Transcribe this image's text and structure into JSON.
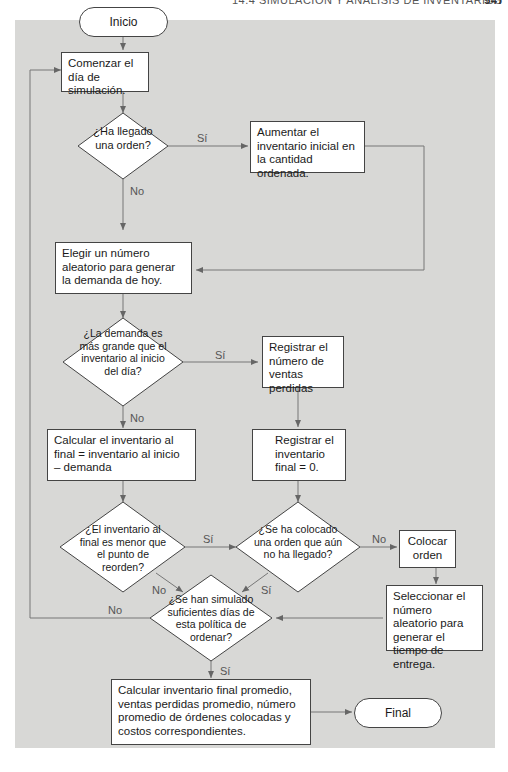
{
  "header": {
    "running_title": "14.4   SIMULACIÓN Y ANÁLISIS DE INVENTARIOS",
    "page_number": "547"
  },
  "flowchart": {
    "start": "Inicio",
    "end": "Final",
    "steps": {
      "begin_day": "Comenzar el día de simulación.",
      "increase_inventory": "Aumentar el inventario inicial en la cantidad ordenada.",
      "random_demand": "Elegir un número aleatorio para generar la demanda de hoy.",
      "record_lost_sales": "Registrar el número de ventas perdidas",
      "calc_ending_inventory": "Calcular el inventario al final = inventario al inicio – demanda",
      "record_zero_inventory": "Registrar el inventario final = 0.",
      "place_order": "Colocar orden",
      "random_lead_time": "Seleccionar el número aleatorio para generar el tiempo de entrega.",
      "compute_results": "Calcular inventario final promedio, ventas perdidas promedio, número promedio de órdenes colocadas y costos correspondientes."
    },
    "decisions": {
      "order_arrived": "¿Ha llegado una orden?",
      "demand_gt_inventory": "¿La demanda es más grande que el inventario al inicio del día?",
      "below_reorder": "¿El inventario al final es menor que el punto de reorden?",
      "order_pending": "¿Se ha colocado una orden que aún no ha llegado?",
      "enough_days": "¿Se han simulado suficientes días de esta política de ordenar?"
    },
    "labels": {
      "yes": "Sí",
      "no": "No"
    }
  }
}
